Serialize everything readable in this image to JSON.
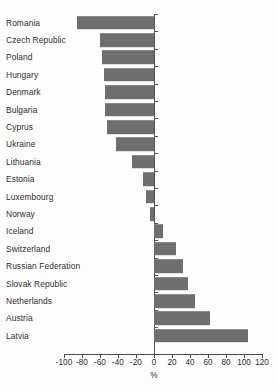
{
  "chart_data": {
    "type": "bar",
    "orientation": "horizontal",
    "title": "",
    "subtitle": "",
    "xlabel": "%",
    "ylabel": "",
    "xlim": [
      -100,
      120
    ],
    "xticks": [
      -100,
      -80,
      -60,
      -40,
      -20,
      0,
      20,
      40,
      60,
      80,
      100,
      120
    ],
    "xticklabels": [
      "-100",
      "-80",
      "-60",
      "-40",
      "-20",
      "0",
      "20",
      "40",
      "60",
      "80",
      "100",
      "120"
    ],
    "grid": false,
    "legend": null,
    "bar_color": "#6e6e6e",
    "categories": [
      "Romania",
      "Czech Republic",
      "Poland",
      "Hungary",
      "Denmark",
      "Bulgaria",
      "Cyprus",
      "Ukraine",
      "Lithuania",
      "Estonia",
      "Luxembourg",
      "Norway",
      "Iceland",
      "Switzerland",
      "Russian Federation",
      "Slovak Republic",
      "Netherlands",
      "Austria",
      "Latvia"
    ],
    "values": [
      -86,
      -60,
      -58,
      -56,
      -55,
      -54,
      -52,
      -42,
      -24,
      -12,
      -9,
      -4,
      10,
      24,
      32,
      38,
      46,
      62,
      104
    ]
  }
}
